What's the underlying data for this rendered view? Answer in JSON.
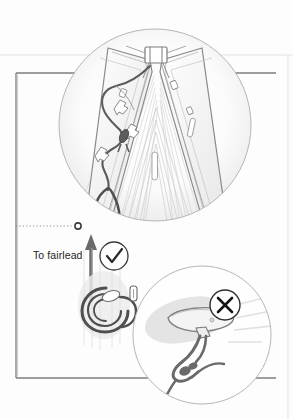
{
  "figure": {
    "kind": "technical-instruction-illustration",
    "background_color": "#fdfdfd",
    "line_color": "#8c8c8c",
    "rope_color": "#575757",
    "text_color": "#1d1d1d"
  },
  "labels": {
    "to_fairlead": "To fairlead"
  },
  "markers": {
    "correct": {
      "glyph": "check",
      "meaning": "correct method",
      "cx": 114,
      "cy": 256,
      "r": 14
    },
    "incorrect": {
      "glyph": "cross",
      "meaning": "incorrect method",
      "cx": 225,
      "cy": 305,
      "r": 15
    }
  },
  "callouts": {
    "main_detail": {
      "cx": 155,
      "cy": 125,
      "r": 97
    },
    "wrong_detail": {
      "cx": 202,
      "cy": 335,
      "r": 70
    }
  },
  "leader": {
    "style": "dotted",
    "from_x": 16,
    "to_x": 74,
    "y": 226,
    "endpoint_marker": "small-open-circle"
  },
  "arrow": {
    "direction": "up",
    "x": 91,
    "tip_y": 236,
    "tail_y": 302,
    "meaning": "pull direction toward fairlead"
  },
  "page_frame": {
    "left_box": {
      "x": 16,
      "y": 73,
      "w": 260,
      "h": 305
    },
    "top_rule_y": 55,
    "right_rule_x": 288
  }
}
